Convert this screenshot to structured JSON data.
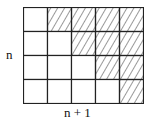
{
  "labels": {
    "rows": "n",
    "cols": "n + 1"
  },
  "grid": {
    "rows": 4,
    "cols": 5,
    "hatched": [
      [
        false,
        true,
        true,
        true,
        true
      ],
      [
        false,
        false,
        true,
        true,
        true
      ],
      [
        false,
        false,
        false,
        true,
        true
      ],
      [
        false,
        false,
        false,
        false,
        true
      ]
    ],
    "line_color": "#222222",
    "hatch_color": "#333333"
  }
}
